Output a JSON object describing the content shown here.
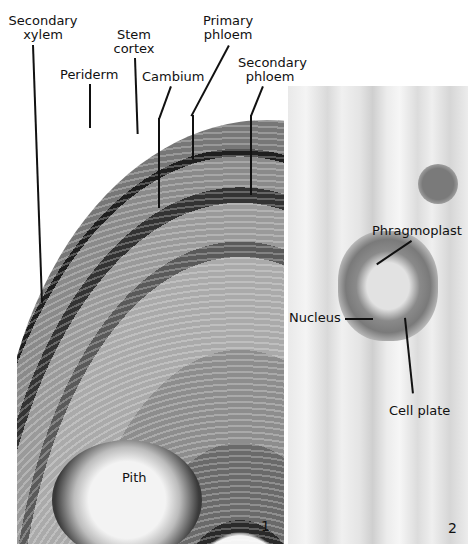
{
  "figure": {
    "panels": [
      {
        "number": "1",
        "description": "Transverse section of woody stem",
        "labels": {
          "secondary_xylem": [
            "Secondary",
            "xylem"
          ],
          "periderm": "Periderm",
          "stem_cortex": [
            "Stem",
            "cortex"
          ],
          "cambium": "Cambium",
          "primary_phloem": [
            "Primary",
            "phloem"
          ],
          "secondary_phloem": [
            "Secondary",
            "phloem"
          ],
          "pith": "Pith"
        }
      },
      {
        "number": "2",
        "description": "Dividing cell showing phragmoplast",
        "labels": {
          "phragmoplast": "Phragmoplast",
          "nucleus": "Nucleus",
          "cell_plate": "Cell plate"
        }
      }
    ]
  }
}
